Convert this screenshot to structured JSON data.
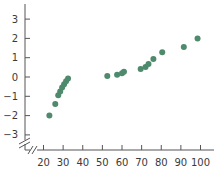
{
  "chart_data": {
    "type": "scatter",
    "title": "",
    "xlabel": "",
    "ylabel": "",
    "xlim": [
      20,
      100
    ],
    "ylim": [
      -3,
      3
    ],
    "grid": false,
    "legend": null,
    "x_ticks": [
      20,
      30,
      40,
      50,
      60,
      70,
      80,
      90,
      100
    ],
    "x_tick_labels": [
      "20",
      "30",
      "40",
      "50",
      "60",
      "70",
      "80",
      "90",
      "100"
    ],
    "y_ticks": [
      3,
      2,
      1,
      0,
      -1,
      -2,
      -3
    ],
    "y_tick_labels": [
      "3",
      "2",
      "1",
      "0",
      "−1",
      "−2",
      "−3"
    ],
    "axis_breaks": {
      "x": true,
      "y": true
    },
    "marker_color": "#4e8a6c",
    "series": [
      {
        "name": "points",
        "points": [
          {
            "x": 23,
            "y": -2.0
          },
          {
            "x": 26,
            "y": -1.4
          },
          {
            "x": 27.5,
            "y": -0.95
          },
          {
            "x": 28.5,
            "y": -0.75
          },
          {
            "x": 29.5,
            "y": -0.55
          },
          {
            "x": 30.5,
            "y": -0.38
          },
          {
            "x": 31.5,
            "y": -0.22
          },
          {
            "x": 32.5,
            "y": -0.08
          },
          {
            "x": 52.5,
            "y": 0.05
          },
          {
            "x": 57.5,
            "y": 0.12
          },
          {
            "x": 60,
            "y": 0.2
          },
          {
            "x": 61,
            "y": 0.27
          },
          {
            "x": 69.5,
            "y": 0.42
          },
          {
            "x": 72,
            "y": 0.52
          },
          {
            "x": 73.5,
            "y": 0.67
          },
          {
            "x": 76,
            "y": 0.93
          },
          {
            "x": 80.5,
            "y": 1.28
          },
          {
            "x": 91.5,
            "y": 1.55
          },
          {
            "x": 98.5,
            "y": 2.0
          }
        ]
      }
    ]
  }
}
